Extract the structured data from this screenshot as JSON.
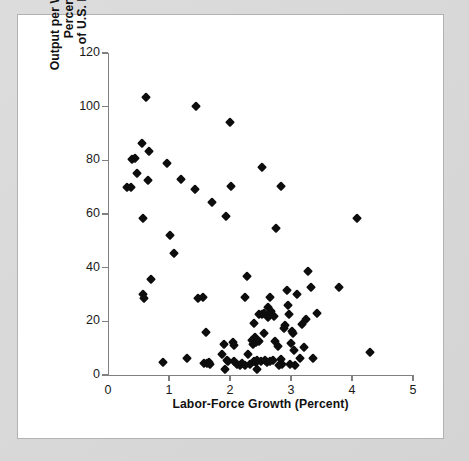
{
  "figure": {
    "background_color": "#d9d9d9",
    "panel_color": "#ffffff",
    "marker_color": "#0d0d0d",
    "axis_color": "#808080"
  },
  "chart_data": {
    "type": "scatter",
    "title": "",
    "xlabel": "Labor-Force Growth (Percent)",
    "ylabel": "Output per Worker (as Percentage of U.S. Level)",
    "ylabel_line1": "Output per Worker (as Percentage",
    "ylabel_line2": "of U.S. Level)",
    "xlim": [
      0,
      5
    ],
    "ylim": [
      0,
      120
    ],
    "xticks": [
      0,
      1,
      2,
      3,
      4,
      5
    ],
    "yticks": [
      0,
      20,
      40,
      60,
      80,
      100,
      120
    ],
    "xtick_labels": [
      "0",
      "1",
      "2",
      "3",
      "4",
      "5"
    ],
    "ytick_labels": [
      "0",
      "20",
      "40",
      "60",
      "80",
      "100",
      "120"
    ],
    "grid": false,
    "legend": null,
    "marker": "diamond",
    "points": [
      [
        0.31,
        70.0
      ],
      [
        0.37,
        70.0
      ],
      [
        0.4,
        80.5
      ],
      [
        0.44,
        80.8
      ],
      [
        0.47,
        75.3
      ],
      [
        0.55,
        86.6
      ],
      [
        0.57,
        58.5
      ],
      [
        0.58,
        30.3
      ],
      [
        0.59,
        28.7
      ],
      [
        0.62,
        103.6
      ],
      [
        0.66,
        72.6
      ],
      [
        0.68,
        83.4
      ],
      [
        0.71,
        35.8
      ],
      [
        0.9,
        4.8
      ],
      [
        0.96,
        79.0
      ],
      [
        1.01,
        52.3
      ],
      [
        1.09,
        45.4
      ],
      [
        1.19,
        72.9
      ],
      [
        1.29,
        6.4
      ],
      [
        1.42,
        69.2
      ],
      [
        1.45,
        100.2
      ],
      [
        1.48,
        28.7
      ],
      [
        1.55,
        29.2
      ],
      [
        1.58,
        4.6
      ],
      [
        1.61,
        16.2
      ],
      [
        1.63,
        4.3
      ],
      [
        1.66,
        5.0
      ],
      [
        1.68,
        4.2
      ],
      [
        1.71,
        64.6
      ],
      [
        1.87,
        7.7
      ],
      [
        1.9,
        11.4
      ],
      [
        1.91,
        2.1
      ],
      [
        1.93,
        59.4
      ],
      [
        1.95,
        5.6
      ],
      [
        1.97,
        5.4
      ],
      [
        2.0,
        94.2
      ],
      [
        2.02,
        70.6
      ],
      [
        2.05,
        12.3
      ],
      [
        2.06,
        11.3
      ],
      [
        2.07,
        5.1
      ],
      [
        2.12,
        4.0
      ],
      [
        2.17,
        3.9
      ],
      [
        2.2,
        4.3
      ],
      [
        2.24,
        3.6
      ],
      [
        2.25,
        29.0
      ],
      [
        2.28,
        37.0
      ],
      [
        2.3,
        7.8
      ],
      [
        2.33,
        4.2
      ],
      [
        2.36,
        13.0
      ],
      [
        2.38,
        11.7
      ],
      [
        2.39,
        5.2
      ],
      [
        2.4,
        19.4
      ],
      [
        2.41,
        14.1
      ],
      [
        2.42,
        5.0
      ],
      [
        2.43,
        12.2
      ],
      [
        2.44,
        2.3
      ],
      [
        2.45,
        5.5
      ],
      [
        2.47,
        22.9
      ],
      [
        2.48,
        12.5
      ],
      [
        2.5,
        5.2
      ],
      [
        2.52,
        77.4
      ],
      [
        2.53,
        22.6
      ],
      [
        2.55,
        15.6
      ],
      [
        2.56,
        23.0
      ],
      [
        2.58,
        5.6
      ],
      [
        2.6,
        4.9
      ],
      [
        2.62,
        21.5
      ],
      [
        2.63,
        25.5
      ],
      [
        2.65,
        5.3
      ],
      [
        2.66,
        29.0
      ],
      [
        2.68,
        23.9
      ],
      [
        2.7,
        5.6
      ],
      [
        2.72,
        22.1
      ],
      [
        2.74,
        12.5
      ],
      [
        2.76,
        54.7
      ],
      [
        2.78,
        10.8
      ],
      [
        2.8,
        3.6
      ],
      [
        2.83,
        6.0
      ],
      [
        2.84,
        70.5
      ],
      [
        2.86,
        4.1
      ],
      [
        2.88,
        17.5
      ],
      [
        2.9,
        18.8
      ],
      [
        2.93,
        31.5
      ],
      [
        2.95,
        26.0
      ],
      [
        2.97,
        22.7
      ],
      [
        2.99,
        4.0
      ],
      [
        3.0,
        12.1
      ],
      [
        3.02,
        16.3
      ],
      [
        3.03,
        15.6
      ],
      [
        3.05,
        9.5
      ],
      [
        3.07,
        3.7
      ],
      [
        3.1,
        30.2
      ],
      [
        3.14,
        6.4
      ],
      [
        3.18,
        19.0
      ],
      [
        3.22,
        10.5
      ],
      [
        3.25,
        21.0
      ],
      [
        3.28,
        38.8
      ],
      [
        3.33,
        32.8
      ],
      [
        3.36,
        6.5
      ],
      [
        3.42,
        23.2
      ],
      [
        3.78,
        32.8
      ],
      [
        4.08,
        58.4
      ],
      [
        4.3,
        8.6
      ]
    ],
    "n_points": 103
  }
}
